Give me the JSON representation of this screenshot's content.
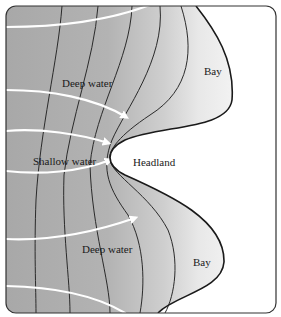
{
  "labels": {
    "deep_water_top": "Deep water",
    "shallow_water": "Shallow water",
    "headland": "Headland",
    "deep_water_bottom": "Deep water",
    "bay_top": "Bay",
    "bay_bottom": "Bay"
  },
  "colors": {
    "water_dark": "#a9a9a9",
    "water_light": "#e6e6e6",
    "land": "#ffffff",
    "contour": "#2a2a2a",
    "wave_ray": "#ffffff",
    "frame": "#333333"
  }
}
